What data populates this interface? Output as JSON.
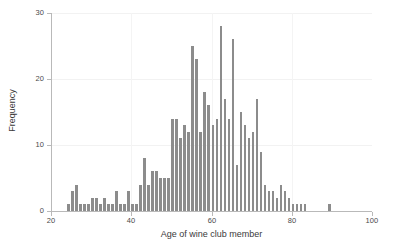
{
  "chart_data": {
    "type": "bar",
    "title": "",
    "subtitle": "",
    "xlabel": "Age of wine club member",
    "ylabel": "Frequency",
    "xlim": [
      20,
      100
    ],
    "ylim": [
      0,
      30
    ],
    "xticks": [
      20,
      40,
      60,
      80,
      100
    ],
    "yticks": [
      0,
      10,
      20,
      30
    ],
    "xtick_labels": [
      "20",
      "40",
      "60",
      "80",
      "100"
    ],
    "ytick_labels": [
      "0",
      "10",
      "20",
      "30"
    ],
    "grid": false,
    "legend": null,
    "bin_width": 1,
    "bar_color": "#8c8c8c",
    "axis_color": "#b9b9b9",
    "text_color": "#3a3a3a",
    "background": "#ffffff",
    "categories": [
      24,
      25,
      26,
      27,
      28,
      29,
      30,
      31,
      32,
      33,
      34,
      35,
      36,
      37,
      38,
      39,
      40,
      41,
      42,
      43,
      44,
      45,
      46,
      47,
      48,
      49,
      50,
      51,
      52,
      53,
      54,
      55,
      56,
      57,
      58,
      59,
      60,
      61,
      62,
      63,
      64,
      65,
      66,
      67,
      68,
      69,
      70,
      71,
      72,
      73,
      74,
      75,
      76,
      77,
      78,
      79,
      80,
      81,
      82,
      83,
      89
    ],
    "values": [
      1,
      3,
      4,
      1,
      1,
      1,
      2,
      2,
      1,
      2,
      1,
      1,
      3,
      1,
      1,
      3,
      1,
      1,
      4,
      8,
      4,
      6,
      6,
      5,
      5,
      5,
      14,
      14,
      11,
      13,
      12,
      25,
      23,
      12,
      18,
      16,
      13,
      14,
      28,
      17,
      14,
      26,
      7,
      15,
      13,
      11,
      12,
      17,
      9,
      4,
      3,
      3,
      2,
      4,
      3,
      2,
      1,
      1,
      1,
      1,
      1
    ]
  },
  "axes": {
    "x_title": "Age of wine club member",
    "y_title": "Frequency"
  }
}
